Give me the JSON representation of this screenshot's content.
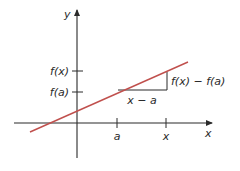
{
  "diagram": {
    "axes": {
      "x_label": "x",
      "y_label": "y"
    },
    "y_ticks": [
      {
        "label": "f(x)",
        "y": 71
      },
      {
        "label": "f(a)",
        "y": 92
      }
    ],
    "x_ticks": [
      {
        "label": "a",
        "x": 117
      },
      {
        "label": "x",
        "x": 166
      }
    ],
    "annotations": {
      "run": "x − a",
      "rise": "f(x) − f(a)"
    },
    "colors": {
      "axis": "#2a2a2a",
      "line": "#c0504d"
    }
  }
}
